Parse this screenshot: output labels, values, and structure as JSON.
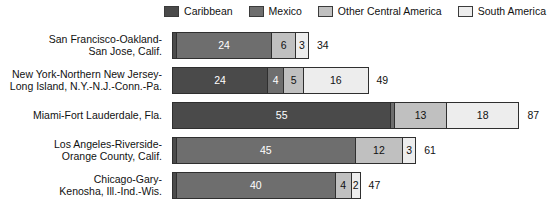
{
  "chart_data": {
    "type": "bar",
    "orientation": "horizontal",
    "stacked": true,
    "title": "",
    "xlabel": "",
    "ylabel": "",
    "xlim": [
      0,
      87
    ],
    "grid": false,
    "legend_position": "top-right",
    "categories": [
      "San Francisco-Oakland-San Jose, Calif.",
      "New York-Northern New Jersey-Long Island, N.Y.-N.J.-Conn.-Pa.",
      "Miami-Fort Lauderdale, Fla.",
      "Los Angeles-Riverside-Orange County, Calif.",
      "Chicago-Gary-Kenosha, Ill.-Ind.-Wis."
    ],
    "series": [
      {
        "name": "Caribbean",
        "color": "#4a4a4a",
        "values": [
          1,
          24,
          55,
          1,
          1
        ]
      },
      {
        "name": "Mexico",
        "color": "#6e6e6e",
        "values": [
          24,
          4,
          1,
          45,
          40
        ]
      },
      {
        "name": "Other Central America",
        "color": "#c0c0c0",
        "values": [
          6,
          5,
          13,
          12,
          4
        ]
      },
      {
        "name": "South America",
        "color": "#ededed",
        "values": [
          3,
          16,
          18,
          3,
          2
        ]
      }
    ],
    "totals": [
      34,
      49,
      87,
      61,
      47
    ]
  },
  "legend": {
    "items": [
      {
        "label": "Caribbean",
        "color": "#4a4a4a"
      },
      {
        "label": "Mexico",
        "color": "#6e6e6e"
      },
      {
        "label": "Other Central America",
        "color": "#c0c0c0"
      },
      {
        "label": "South America",
        "color": "#ededed"
      }
    ]
  },
  "rows": [
    {
      "label_line1": "San Francisco-Oakland-",
      "label_line2": "San Jose, Calif.",
      "total": "34",
      "segments": [
        {
          "series": "Caribbean",
          "value": 1,
          "display": "",
          "color": "#4a4a4a",
          "tone": "dark"
        },
        {
          "series": "Mexico",
          "value": 24,
          "display": "24",
          "color": "#6e6e6e",
          "tone": "dark"
        },
        {
          "series": "Other Central America",
          "value": 6,
          "display": "6",
          "color": "#c0c0c0",
          "tone": "light"
        },
        {
          "series": "South America",
          "value": 3,
          "display": "3",
          "color": "#ededed",
          "tone": "light"
        }
      ]
    },
    {
      "label_line1": "New York-Northern New Jersey-",
      "label_line2": "Long Island, N.Y.-N.J.-Conn.-Pa.",
      "total": "49",
      "segments": [
        {
          "series": "Caribbean",
          "value": 24,
          "display": "24",
          "color": "#4a4a4a",
          "tone": "dark"
        },
        {
          "series": "Mexico",
          "value": 4,
          "display": "4",
          "color": "#6e6e6e",
          "tone": "dark"
        },
        {
          "series": "Other Central America",
          "value": 5,
          "display": "5",
          "color": "#c0c0c0",
          "tone": "light"
        },
        {
          "series": "South America",
          "value": 16,
          "display": "16",
          "color": "#ededed",
          "tone": "light"
        }
      ]
    },
    {
      "label_line1": "Miami-Fort Lauderdale, Fla.",
      "label_line2": "",
      "total": "87",
      "segments": [
        {
          "series": "Caribbean",
          "value": 55,
          "display": "55",
          "color": "#4a4a4a",
          "tone": "dark"
        },
        {
          "series": "Mexico",
          "value": 1,
          "display": "",
          "color": "#6e6e6e",
          "tone": "dark"
        },
        {
          "series": "Other Central America",
          "value": 13,
          "display": "13",
          "color": "#c0c0c0",
          "tone": "light"
        },
        {
          "series": "South America",
          "value": 18,
          "display": "18",
          "color": "#ededed",
          "tone": "light"
        }
      ]
    },
    {
      "label_line1": "Los Angeles-Riverside-",
      "label_line2": "Orange County, Calif.",
      "total": "61",
      "segments": [
        {
          "series": "Caribbean",
          "value": 1,
          "display": "",
          "color": "#4a4a4a",
          "tone": "dark"
        },
        {
          "series": "Mexico",
          "value": 45,
          "display": "45",
          "color": "#6e6e6e",
          "tone": "dark"
        },
        {
          "series": "Other Central America",
          "value": 12,
          "display": "12",
          "color": "#c0c0c0",
          "tone": "light"
        },
        {
          "series": "South America",
          "value": 3,
          "display": "3",
          "color": "#ededed",
          "tone": "light"
        }
      ]
    },
    {
      "label_line1": "Chicago-Gary-",
      "label_line2": "Kenosha, Ill.-Ind.-Wis.",
      "total": "47",
      "segments": [
        {
          "series": "Caribbean",
          "value": 1,
          "display": "",
          "color": "#4a4a4a",
          "tone": "dark"
        },
        {
          "series": "Mexico",
          "value": 40,
          "display": "40",
          "color": "#6e6e6e",
          "tone": "dark"
        },
        {
          "series": "Other Central America",
          "value": 4,
          "display": "4",
          "color": "#c0c0c0",
          "tone": "light"
        },
        {
          "series": "South America",
          "value": 2,
          "display": "2",
          "color": "#ededed",
          "tone": "light"
        }
      ]
    }
  ],
  "layout": {
    "bar_origin_x": 172,
    "px_per_unit": 3.97,
    "total_gap_px": 8
  }
}
